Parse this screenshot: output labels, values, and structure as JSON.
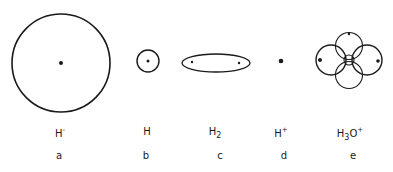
{
  "species": [
    {
      "id": "a",
      "formula": "H",
      "charge": "-",
      "subscript": "",
      "letter": "a"
    },
    {
      "id": "b",
      "formula": "H",
      "charge": "",
      "subscript": "",
      "letter": "b"
    },
    {
      "id": "c",
      "formula": "H",
      "charge": "",
      "subscript": "2",
      "letter": "c"
    },
    {
      "id": "d",
      "formula": "H",
      "charge": "+",
      "subscript": "",
      "letter": "d"
    },
    {
      "id": "e",
      "formula": "H",
      "charge": "+",
      "subscript": "3",
      "suffix": "O",
      "letter": "e"
    }
  ],
  "colors": {
    "stroke": "#1a1a1a",
    "background": "#ffffff"
  }
}
